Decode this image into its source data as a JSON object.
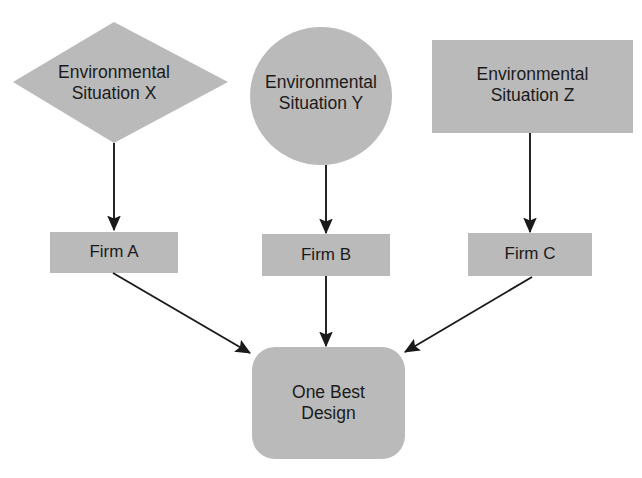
{
  "canvas": {
    "width": 642,
    "height": 478,
    "background": "#ffffff",
    "shape_fill": "#bababa",
    "shape_fill_alt": "#b9b9b9",
    "line_color": "#1a1a1a",
    "text_color": "#1a1a1a"
  },
  "top_cut_text": "",
  "nodes": {
    "env_x": {
      "label_line1": "Environmental",
      "label_line2": "Situation X",
      "shape": "diamond",
      "fill": "#bababa"
    },
    "env_y": {
      "label_line1": "Environmental",
      "label_line2": "Situation Y",
      "shape": "circle",
      "fill": "#bababa"
    },
    "env_z": {
      "label_line1": "Environmental",
      "label_line2": "Situation Z",
      "shape": "rectangle",
      "fill": "#bababa"
    },
    "firm_a": {
      "label": "Firm A",
      "shape": "rectangle",
      "fill": "#bababa"
    },
    "firm_b": {
      "label": "Firm B",
      "shape": "rectangle",
      "fill": "#bababa"
    },
    "firm_c": {
      "label": "Firm C",
      "shape": "rectangle",
      "fill": "#bababa"
    },
    "one_best_design": {
      "label_line1": "One Best",
      "label_line2": "Design",
      "shape": "rounded-rectangle",
      "fill": "#bababa"
    }
  },
  "edges": [
    {
      "from": "env_x",
      "to": "firm_a",
      "style": "straight-vertical-arrow"
    },
    {
      "from": "env_y",
      "to": "firm_b",
      "style": "straight-vertical-arrow"
    },
    {
      "from": "env_z",
      "to": "firm_c",
      "style": "straight-vertical-arrow"
    },
    {
      "from": "firm_a",
      "to": "one_best_design",
      "style": "diagonal-arrow"
    },
    {
      "from": "firm_b",
      "to": "one_best_design",
      "style": "straight-vertical-arrow"
    },
    {
      "from": "firm_c",
      "to": "one_best_design",
      "style": "diagonal-arrow"
    }
  ]
}
